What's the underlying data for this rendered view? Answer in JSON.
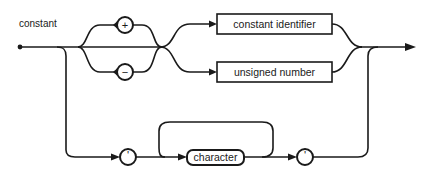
{
  "diagram": {
    "title": "constant",
    "terminals": {
      "plus": "+",
      "minus": "−",
      "open_quote": "'",
      "close_quote": "'"
    },
    "nonterminals": {
      "constant_identifier": "constant identifier",
      "unsigned_number": "unsigned number",
      "character": "character"
    },
    "colors": {
      "stroke": "#1a1a1a",
      "background": "#ffffff"
    }
  }
}
